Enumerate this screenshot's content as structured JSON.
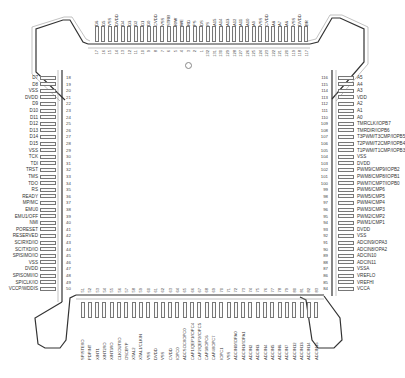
{
  "diagram": {
    "package_pin_count": 132,
    "pin1_marker": "circle",
    "left_side": {
      "pins": [
        {
          "num": "18",
          "name": "D7"
        },
        {
          "num": "19",
          "name": "D8"
        },
        {
          "num": "20",
          "name": "VSS"
        },
        {
          "num": "21",
          "name": "DVDD"
        },
        {
          "num": "22",
          "name": "D9"
        },
        {
          "num": "23",
          "name": "D10"
        },
        {
          "num": "24",
          "name": "D11"
        },
        {
          "num": "25",
          "name": "D12"
        },
        {
          "num": "26",
          "name": "D13"
        },
        {
          "num": "27",
          "name": "D14"
        },
        {
          "num": "28",
          "name": "D15"
        },
        {
          "num": "29",
          "name": "VSS"
        },
        {
          "num": "30",
          "name": "TCK"
        },
        {
          "num": "31",
          "name": "TDI"
        },
        {
          "num": "32",
          "name": "TRST"
        },
        {
          "num": "33",
          "name": "TMS"
        },
        {
          "num": "34",
          "name": "TDO"
        },
        {
          "num": "35",
          "name": "RS"
        },
        {
          "num": "36",
          "name": "READY"
        },
        {
          "num": "37",
          "name": "MP/MC"
        },
        {
          "num": "38",
          "name": "EMU0"
        },
        {
          "num": "39",
          "name": "EMU1/OFF"
        },
        {
          "num": "40",
          "name": "NMI"
        },
        {
          "num": "41",
          "name": "PORESET"
        },
        {
          "num": "42",
          "name": "RESERVED"
        },
        {
          "num": "43",
          "name": "SCIRXD/IO"
        },
        {
          "num": "44",
          "name": "SCITXD/IO"
        },
        {
          "num": "45",
          "name": "SPISIMO/IO"
        },
        {
          "num": "46",
          "name": "VSS"
        },
        {
          "num": "47",
          "name": "DVDD"
        },
        {
          "num": "48",
          "name": "SPISOMI/IO"
        },
        {
          "num": "49",
          "name": "SPICLK/IO"
        },
        {
          "num": "50",
          "name": "VCCP/WDDIS"
        }
      ]
    },
    "right_side": {
      "pins": [
        {
          "num": "116",
          "name": "A5"
        },
        {
          "num": "115",
          "name": "A4"
        },
        {
          "num": "114",
          "name": "A3"
        },
        {
          "num": "113",
          "name": "VDD"
        },
        {
          "num": "112",
          "name": "A2"
        },
        {
          "num": "111",
          "name": "A1"
        },
        {
          "num": "110",
          "name": "A0"
        },
        {
          "num": "109",
          "name": "TMRCLK/IOPB7"
        },
        {
          "num": "108",
          "name": "TMRDIR/IOPB6"
        },
        {
          "num": "107",
          "name": "T3PWM/T3CMP/IOPB5"
        },
        {
          "num": "106",
          "name": "T2PWM/T2CMP/IOPB4"
        },
        {
          "num": "105",
          "name": "T1PWM/T1CMP/IOPB3"
        },
        {
          "num": "104",
          "name": "VSS"
        },
        {
          "num": "103",
          "name": "DVDD"
        },
        {
          "num": "102",
          "name": "PWM9/CMP9/IOPB2"
        },
        {
          "num": "101",
          "name": "PWM8/CMP8/IOPB1"
        },
        {
          "num": "100",
          "name": "PWM7/CMP7/IOPB0"
        },
        {
          "num": "99",
          "name": "PWM6/CMP6"
        },
        {
          "num": "98",
          "name": "PWM5/CMP5"
        },
        {
          "num": "97",
          "name": "PWM4/CMP4"
        },
        {
          "num": "96",
          "name": "PWM3/CMP3"
        },
        {
          "num": "95",
          "name": "PWM2/CMP2"
        },
        {
          "num": "94",
          "name": "PWM1/CMP1"
        },
        {
          "num": "93",
          "name": "DVDD"
        },
        {
          "num": "92",
          "name": "VSS"
        },
        {
          "num": "91",
          "name": "ADCIN9/OPA3"
        },
        {
          "num": "90",
          "name": "ADCIN8/OPA2"
        },
        {
          "num": "89",
          "name": "ADCIN10"
        },
        {
          "num": "88",
          "name": "ADCIN11"
        },
        {
          "num": "87",
          "name": "VSSA"
        },
        {
          "num": "86",
          "name": "VREFLO"
        },
        {
          "num": "85",
          "name": "VREFHI"
        },
        {
          "num": "84",
          "name": "VCCA"
        }
      ]
    },
    "top_side": {
      "pins": [
        {
          "num": "17",
          "name": "D6"
        },
        {
          "num": "16",
          "name": "D5"
        },
        {
          "num": "15",
          "name": "VSS"
        },
        {
          "num": "14",
          "name": "DVDD"
        },
        {
          "num": "13",
          "name": "D4"
        },
        {
          "num": "12",
          "name": "D3"
        },
        {
          "num": "11",
          "name": "D2"
        },
        {
          "num": "10",
          "name": "D1"
        },
        {
          "num": "9",
          "name": "D0"
        },
        {
          "num": "8",
          "name": "CVDD"
        },
        {
          "num": "7",
          "name": "VSS"
        },
        {
          "num": "6",
          "name": "STRB"
        },
        {
          "num": "5",
          "name": "R/W"
        },
        {
          "num": "4",
          "name": "WE"
        },
        {
          "num": "3",
          "name": "RD"
        },
        {
          "num": "2",
          "name": "PS"
        },
        {
          "num": "1",
          "name": "DS"
        },
        {
          "num": "132",
          "name": "IS"
        },
        {
          "num": "131",
          "name": "A15"
        },
        {
          "num": "130",
          "name": "A14"
        },
        {
          "num": "129",
          "name": "A13"
        },
        {
          "num": "128",
          "name": "A12"
        },
        {
          "num": "127",
          "name": "A11"
        },
        {
          "num": "126",
          "name": "A10"
        },
        {
          "num": "125",
          "name": "A9"
        },
        {
          "num": "124",
          "name": "VSS"
        },
        {
          "num": "123",
          "name": "CVDD"
        },
        {
          "num": "122",
          "name": "A8"
        },
        {
          "num": "121",
          "name": "A7"
        },
        {
          "num": "120",
          "name": "A6"
        },
        {
          "num": "119",
          "name": "VSS"
        },
        {
          "num": "118",
          "name": "DVDD"
        },
        {
          "num": "117",
          "name": "BR"
        }
      ]
    },
    "bottom_side": {
      "pins": [
        {
          "num": "51",
          "name": "SPISTE/IO"
        },
        {
          "num": "52",
          "name": "PDPINT"
        },
        {
          "num": "53",
          "name": "XINT1"
        },
        {
          "num": "54",
          "name": "XINT2/IO"
        },
        {
          "num": "55",
          "name": "XINT3/IO"
        },
        {
          "num": "56",
          "name": "CLKOUT/IO"
        },
        {
          "num": "57",
          "name": "OSCBYP"
        },
        {
          "num": "58",
          "name": "XTAL2"
        },
        {
          "num": "59",
          "name": "XTAL1/CLKIN"
        },
        {
          "num": "60",
          "name": "VSS"
        },
        {
          "num": "61",
          "name": "DVDD"
        },
        {
          "num": "62",
          "name": "VSS"
        },
        {
          "num": "63",
          "name": "CVDD"
        },
        {
          "num": "64",
          "name": "IOPC0"
        },
        {
          "num": "65",
          "name": "ADCSOC/IOPC0"
        },
        {
          "num": "66",
          "name": "CAP1/QEP1/IOPC4"
        },
        {
          "num": "67",
          "name": "CAP2/QEP2/IOPC5"
        },
        {
          "num": "68",
          "name": "CAP3/IOPC6"
        },
        {
          "num": "69",
          "name": "CAP4/IOPC7"
        },
        {
          "num": "70",
          "name": "IOPC1"
        },
        {
          "num": "71",
          "name": "VSS"
        },
        {
          "num": "72",
          "name": "ADCIN0/IOPA0"
        },
        {
          "num": "73",
          "name": "ADCIN1/IOPA1"
        },
        {
          "num": "74",
          "name": "ADCIN2"
        },
        {
          "num": "75",
          "name": "ADCIN3"
        },
        {
          "num": "76",
          "name": "ADCIN4"
        },
        {
          "num": "77",
          "name": "ADCIN5"
        },
        {
          "num": "78",
          "name": "ADCIN6"
        },
        {
          "num": "79",
          "name": "ADCIN7"
        },
        {
          "num": "80",
          "name": "ADCIN12"
        },
        {
          "num": "81",
          "name": "ADCIN13"
        },
        {
          "num": "82",
          "name": "ADCIN14"
        },
        {
          "num": "83",
          "name": "ADCIN15"
        }
      ]
    },
    "colors": {
      "outline": "#333333",
      "pad": "#777777",
      "text": "#333333",
      "background": "#ffffff"
    }
  }
}
